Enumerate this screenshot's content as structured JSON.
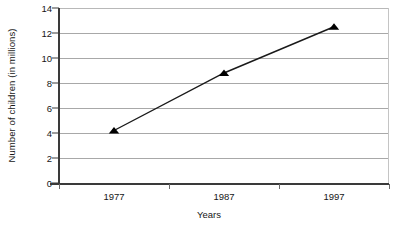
{
  "chart_data": {
    "type": "line",
    "title": "",
    "xlabel": "Years",
    "ylabel": "Number of children (in millions)",
    "categories": [
      "1977",
      "1987",
      "1997"
    ],
    "values": [
      4.2,
      8.8,
      12.5
    ],
    "series": [
      {
        "name": "Number of children",
        "values": [
          4.2,
          8.8,
          12.5
        ],
        "marker": "triangle-up",
        "marker_color": "#000000",
        "line_color": "#1a1a1a"
      }
    ],
    "ylim": [
      0,
      14
    ],
    "ytick_labels": [
      "0",
      "2",
      "4",
      "6",
      "8",
      "10",
      "12",
      "14"
    ],
    "ytick_values": [
      0,
      2,
      4,
      6,
      8,
      10,
      12,
      14
    ],
    "xtick_labels": [
      "1977",
      "1987",
      "1997"
    ],
    "grid": "horizontal",
    "gridline_color": "#a8a8a8",
    "axis_color": "#3a3a3a",
    "legend": "none",
    "legend_position": "none",
    "plot_background": "#ffffff"
  },
  "caption": {
    "text": "",
    "visible": false
  }
}
